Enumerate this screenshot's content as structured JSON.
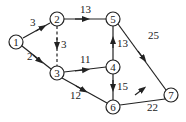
{
  "diagram": {
    "type": "directed-network",
    "nodes": [
      {
        "id": "1",
        "label": "1",
        "x": 16,
        "y": 42
      },
      {
        "id": "2",
        "label": "2",
        "x": 57,
        "y": 19
      },
      {
        "id": "3",
        "label": "3",
        "x": 57,
        "y": 73
      },
      {
        "id": "4",
        "label": "4",
        "x": 113,
        "y": 67
      },
      {
        "id": "5",
        "label": "5",
        "x": 113,
        "y": 19
      },
      {
        "id": "6",
        "label": "6",
        "x": 113,
        "y": 107
      },
      {
        "id": "7",
        "label": "7",
        "x": 171,
        "y": 95
      }
    ],
    "edges": [
      {
        "from": "1",
        "to": "2",
        "weight": "3",
        "style": "solid"
      },
      {
        "from": "1",
        "to": "3",
        "weight": "2",
        "style": "solid"
      },
      {
        "from": "2",
        "to": "5",
        "weight": "13",
        "style": "solid"
      },
      {
        "from": "2",
        "to": "3",
        "weight": "3",
        "style": "dashed"
      },
      {
        "from": "3",
        "to": "4",
        "weight": "11",
        "style": "solid"
      },
      {
        "from": "3",
        "to": "6",
        "weight": "12",
        "style": "solid"
      },
      {
        "from": "4",
        "to": "5",
        "weight": "13",
        "style": "solid"
      },
      {
        "from": "4",
        "to": "6",
        "weight": "15",
        "style": "solid"
      },
      {
        "from": "5",
        "to": "7",
        "weight": "25",
        "style": "solid"
      },
      {
        "from": "6",
        "to": "7",
        "weight": "22",
        "style": "solid"
      }
    ]
  },
  "labels": {
    "n1": "1",
    "n2": "2",
    "n3": "3",
    "n4": "4",
    "n5": "5",
    "n6": "6",
    "n7": "7",
    "e12": "3",
    "e13": "2",
    "e25": "13",
    "e23": "3",
    "e34": "11",
    "e36": "12",
    "e45": "13",
    "e46": "15",
    "e57": "25",
    "e67": "22"
  },
  "colors": {
    "stroke": "#222222",
    "background": "#ffffff"
  }
}
